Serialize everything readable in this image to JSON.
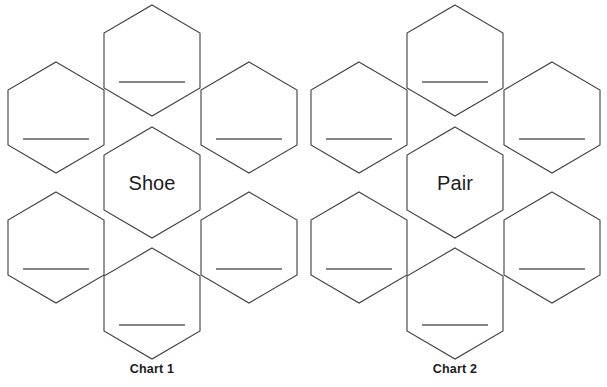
{
  "page": {
    "background_color": "#ffffff",
    "outline_color": "#3f3f3f",
    "writing_line_color": "#5d5d5d",
    "text_color": "#1d1d1d"
  },
  "charts": [
    {
      "id": "chart-1",
      "label": "Chart 1",
      "center_word": "Shoe",
      "petals": [
        {
          "position": "top",
          "value": ""
        },
        {
          "position": "upper-left",
          "value": ""
        },
        {
          "position": "upper-right",
          "value": ""
        },
        {
          "position": "lower-left",
          "value": ""
        },
        {
          "position": "lower-right",
          "value": ""
        },
        {
          "position": "bottom",
          "value": ""
        }
      ]
    },
    {
      "id": "chart-2",
      "label": "Chart 2",
      "center_word": "Pair",
      "petals": [
        {
          "position": "top",
          "value": ""
        },
        {
          "position": "upper-left",
          "value": ""
        },
        {
          "position": "upper-right",
          "value": ""
        },
        {
          "position": "lower-left",
          "value": ""
        },
        {
          "position": "lower-right",
          "value": ""
        },
        {
          "position": "bottom",
          "value": ""
        }
      ]
    }
  ]
}
